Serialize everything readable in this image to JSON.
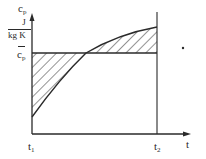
{
  "diagram": {
    "y_axis": {
      "symbol": "c",
      "subscript": "p",
      "unit_numerator": "J",
      "unit_denominator": "kg K"
    },
    "mean_line": {
      "symbol": "c",
      "subscript": "p",
      "overbar": true
    },
    "x_axis": {
      "label": "t"
    },
    "markers": [
      {
        "symbol": "t",
        "subscript": "1"
      },
      {
        "symbol": "t",
        "subscript": "2"
      }
    ],
    "colors": {
      "line": "#2a2a2a",
      "background": "#ffffff"
    }
  }
}
